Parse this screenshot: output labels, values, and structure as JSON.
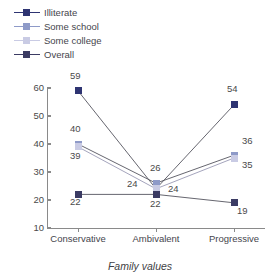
{
  "chart_data": {
    "type": "line",
    "title": "",
    "xlabel": "Family values",
    "ylabel": "",
    "categories": [
      "Conservative",
      "Ambivalent",
      "Progressive"
    ],
    "ylim": [
      10,
      60
    ],
    "yticks": [
      10,
      20,
      30,
      40,
      50,
      60
    ],
    "grid": false,
    "legend_position": "top-left",
    "series": [
      {
        "name": "Illiterate",
        "values": [
          59,
          24,
          54
        ],
        "color": "#2e3472"
      },
      {
        "name": "Some school",
        "values": [
          40,
          26,
          36
        ],
        "color": "#8e9ac8"
      },
      {
        "name": "Some college",
        "values": [
          39,
          24,
          35
        ],
        "color": "#c9cbe4"
      },
      {
        "name": "Overall",
        "values": [
          22,
          22,
          19
        ],
        "color": "#3b3b63"
      }
    ],
    "data_labels": [
      "59",
      "40",
      "39",
      "22",
      "26",
      "24",
      "24",
      "22",
      "54",
      "36",
      "35",
      "19"
    ]
  },
  "legend": {
    "items": [
      {
        "label": "Illiterate"
      },
      {
        "label": "Some school"
      },
      {
        "label": "Some college"
      },
      {
        "label": "Overall"
      }
    ]
  },
  "axis": {
    "x_title": "Family values",
    "x_labels": [
      "Conservative",
      "Ambivalent",
      "Progressive"
    ],
    "y_labels": [
      "60",
      "50",
      "40",
      "30",
      "20",
      "10"
    ]
  },
  "points": {
    "illiterate": [
      {
        "v": "59"
      },
      {
        "v": "24"
      },
      {
        "v": "54"
      }
    ],
    "some_school": [
      {
        "v": "40"
      },
      {
        "v": "26"
      },
      {
        "v": "36"
      }
    ],
    "some_college": [
      {
        "v": "39"
      },
      {
        "v": "24"
      },
      {
        "v": "35"
      }
    ],
    "overall": [
      {
        "v": "22"
      },
      {
        "v": "22"
      },
      {
        "v": "19"
      }
    ]
  }
}
